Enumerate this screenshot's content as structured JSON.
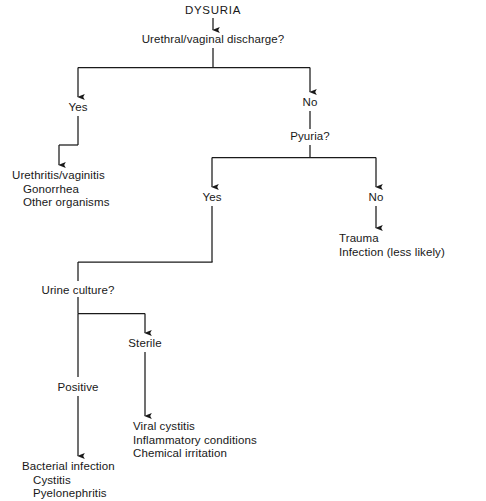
{
  "diagram": {
    "type": "clinical-decision-flowchart",
    "title": "DYSURIA",
    "background_color": "#ffffff",
    "line_color": "#1a1a1a",
    "text_color": "#181818",
    "nodes": {
      "root": "DYSURIA",
      "q_discharge": "Urethral/vaginal discharge?",
      "discharge_yes": "Yes",
      "discharge_no": "No",
      "outcome_urethritis": {
        "line1": "Urethritis/vaginitis",
        "line2": "Gonorrhea",
        "line3": "Other organisms"
      },
      "q_pyuria": "Pyuria?",
      "pyuria_yes": "Yes",
      "pyuria_no": "No",
      "outcome_trauma": {
        "line1": "Trauma",
        "line2": "Infection (less likely)"
      },
      "q_urine_culture": "Urine culture?",
      "culture_positive": "Positive",
      "culture_sterile": "Sterile",
      "outcome_bacterial": {
        "line1": "Bacterial infection",
        "line2": "Cystitis",
        "line3": "Pyelonephritis"
      },
      "outcome_viral": {
        "line1": "Viral cystitis",
        "line2": "Inflammatory conditions",
        "line3": "Chemical irritation"
      }
    },
    "caption": ""
  }
}
